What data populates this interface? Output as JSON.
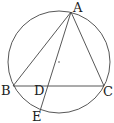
{
  "diagram": {
    "type": "geometry",
    "circle": {
      "cx": 59,
      "cy": 62,
      "r": 51,
      "center_dot": true
    },
    "points": {
      "A": {
        "label": "A",
        "x": 71,
        "y": 12,
        "lx": 73,
        "ly": 12
      },
      "B": {
        "label": "B",
        "x": 13,
        "y": 86,
        "lx": 1,
        "ly": 95
      },
      "C": {
        "label": "C",
        "x": 104,
        "y": 86,
        "lx": 103,
        "ly": 96
      },
      "D": {
        "label": "D",
        "x": 48,
        "y": 86,
        "lx": 34,
        "ly": 95
      },
      "E": {
        "label": "E",
        "x": 40,
        "y": 111,
        "lx": 32,
        "ly": 121
      }
    },
    "segments": [
      [
        "A",
        "B"
      ],
      [
        "A",
        "C"
      ],
      [
        "B",
        "C"
      ],
      [
        "A",
        "E"
      ]
    ],
    "colors": {
      "stroke": "#444444",
      "text": "#222222"
    }
  }
}
